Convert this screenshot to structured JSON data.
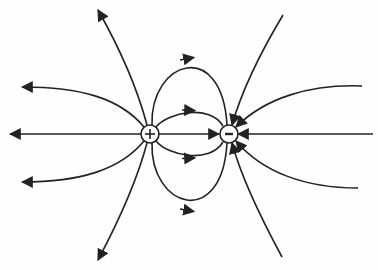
{
  "diagram": {
    "title": "Electric field lines of an electric dipole",
    "colors": {
      "stroke": "#222222",
      "background": "#fefefe"
    },
    "charges": [
      {
        "id": "positive",
        "sign": "+",
        "cx": 150,
        "cy": 134,
        "r": 9
      },
      {
        "id": "negative",
        "sign": "-",
        "cx": 229,
        "cy": 134,
        "r": 9
      }
    ],
    "field_lines": [
      {
        "id": "left-axis",
        "from": "positive",
        "to": "outward-left",
        "direction": "away-from-positive"
      },
      {
        "id": "left-upper",
        "from": "positive",
        "to": "outward-left-up",
        "direction": "away-from-positive"
      },
      {
        "id": "left-lower",
        "from": "positive",
        "to": "outward-left-down",
        "direction": "away-from-positive"
      },
      {
        "id": "top-left",
        "from": "positive",
        "to": "outward-up",
        "direction": "away-from-positive"
      },
      {
        "id": "bottom-left",
        "from": "positive",
        "to": "outward-down",
        "direction": "away-from-positive"
      },
      {
        "id": "center-axis",
        "from": "positive",
        "to": "negative",
        "direction": "positive-to-negative"
      },
      {
        "id": "inner-upper-loop",
        "from": "positive",
        "to": "negative",
        "direction": "positive-to-negative"
      },
      {
        "id": "inner-lower-loop",
        "from": "positive",
        "to": "negative",
        "direction": "positive-to-negative"
      },
      {
        "id": "outer-upper-loop",
        "from": "positive",
        "to": "negative",
        "direction": "positive-to-negative"
      },
      {
        "id": "outer-lower-loop",
        "from": "positive",
        "to": "negative",
        "direction": "positive-to-negative"
      },
      {
        "id": "right-axis",
        "from": "outward-right",
        "to": "negative",
        "direction": "into-negative"
      },
      {
        "id": "right-upper",
        "from": "outward-right-up",
        "to": "negative",
        "direction": "into-negative"
      },
      {
        "id": "right-lower",
        "from": "outward-right-down",
        "to": "negative",
        "direction": "into-negative"
      },
      {
        "id": "top-right",
        "from": "outward-up",
        "to": "negative",
        "direction": "into-negative"
      },
      {
        "id": "bottom-right",
        "from": "outward-down",
        "to": "negative",
        "direction": "into-negative"
      }
    ]
  }
}
